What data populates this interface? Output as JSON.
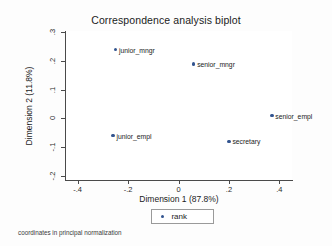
{
  "chart_data": {
    "type": "scatter",
    "title": "Correspondence analysis biplot",
    "xlabel": "Dimension 1 (87.8%)",
    "ylabel": "Dimension 2 (11.8%)",
    "xlim": [
      -0.45,
      0.45
    ],
    "ylim": [
      -0.215,
      0.305
    ],
    "xticks": [
      "-.4",
      "-.2",
      "0",
      ".2",
      ".4"
    ],
    "xtick_values": [
      -0.4,
      -0.2,
      0,
      0.2,
      0.4
    ],
    "yticks": [
      ".3",
      ".2",
      ".1",
      "0",
      "-.1",
      "-.2"
    ],
    "ytick_values": [
      0.3,
      0.2,
      0.1,
      0,
      -0.1,
      -0.2
    ],
    "grid": false,
    "legend_position": "bottom",
    "marker_color": "#32548f",
    "series": [
      {
        "name": "rank",
        "points": [
          {
            "label": "junior_mngr",
            "x": -0.25,
            "y": 0.24
          },
          {
            "label": "senior_mngr",
            "x": 0.06,
            "y": 0.19
          },
          {
            "label": "senior_empl",
            "x": 0.37,
            "y": 0.01
          },
          {
            "label": "junior_empl",
            "x": -0.26,
            "y": -0.06
          },
          {
            "label": "secretary",
            "x": 0.2,
            "y": -0.08
          }
        ]
      }
    ],
    "legend_entries": [
      "rank"
    ],
    "note": "coordinates in principal normalization"
  }
}
